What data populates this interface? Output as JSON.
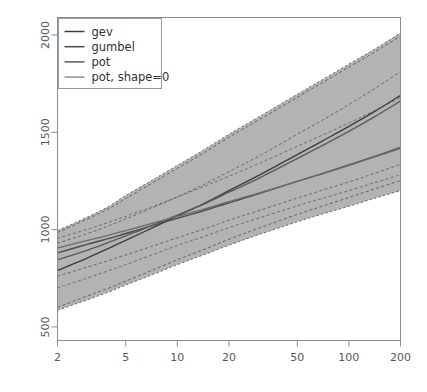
{
  "chart_data": {
    "type": "line",
    "title": "",
    "xlabel": "",
    "ylabel": "",
    "xscale": "log",
    "yscale": "linear",
    "xlim": [
      2,
      200
    ],
    "ylim": [
      430,
      2090
    ],
    "grid": false,
    "legend_position": "top-left",
    "xticks": [
      2,
      5,
      10,
      20,
      50,
      100,
      200
    ],
    "xticklabels": [
      "2",
      "5",
      "10",
      "20",
      "50",
      "100",
      "200"
    ],
    "yticks": [
      500,
      1000,
      1500,
      2000
    ],
    "yticklabels": [
      "500",
      "1000",
      "1500",
      "2000"
    ],
    "band": {
      "name": "confidence-band",
      "fill": "#b3b3b3",
      "x": [
        2,
        3,
        4,
        5,
        7,
        10,
        14,
        20,
        30,
        50,
        70,
        100,
        140,
        200
      ],
      "upper": [
        995,
        1065,
        1120,
        1175,
        1250,
        1330,
        1405,
        1490,
        1580,
        1695,
        1770,
        1850,
        1925,
        2010
      ],
      "lower": [
        585,
        640,
        680,
        715,
        765,
        820,
        868,
        920,
        975,
        1040,
        1080,
        1120,
        1160,
        1200
      ]
    },
    "series": [
      {
        "name": "gev",
        "color": "#3c3c3c",
        "dash": "solid",
        "x": [
          2,
          3,
          4,
          5,
          7,
          10,
          14,
          20,
          30,
          50,
          70,
          100,
          140,
          200
        ],
        "values": [
          790,
          855,
          905,
          945,
          1005,
          1070,
          1130,
          1200,
          1280,
          1385,
          1455,
          1530,
          1605,
          1690
        ]
      },
      {
        "name": "gumbel",
        "color": "#4a4a4a",
        "dash": "solid",
        "x": [
          2,
          3,
          4,
          5,
          7,
          10,
          14,
          20,
          30,
          50,
          70,
          100,
          140,
          200
        ],
        "values": [
          880,
          925,
          955,
          980,
          1018,
          1058,
          1095,
          1138,
          1185,
          1248,
          1288,
          1332,
          1375,
          1422
        ]
      },
      {
        "name": "pot",
        "color": "#5a5a5a",
        "dash": "solid",
        "x": [
          2,
          3,
          4,
          5,
          7,
          10,
          14,
          20,
          30,
          50,
          70,
          100,
          140,
          200
        ],
        "values": [
          845,
          895,
          935,
          968,
          1018,
          1075,
          1128,
          1192,
          1265,
          1365,
          1432,
          1505,
          1578,
          1660
        ]
      },
      {
        "name": "pot, shape=0",
        "color": "#6b6b6b",
        "dash": "solid",
        "x": [
          2,
          3,
          4,
          5,
          7,
          10,
          14,
          20,
          30,
          50,
          70,
          100,
          140,
          200
        ],
        "values": [
          905,
          945,
          972,
          995,
          1030,
          1068,
          1103,
          1143,
          1188,
          1248,
          1287,
          1330,
          1372,
          1418
        ]
      }
    ],
    "ci_curves": [
      {
        "name": "gev-upper-ci",
        "color": "#5e5e5e",
        "dash": "dashed",
        "x": [
          2,
          3,
          4,
          5,
          7,
          10,
          14,
          20,
          30,
          50,
          70,
          100,
          140,
          200
        ],
        "values": [
          985,
          1055,
          1108,
          1160,
          1235,
          1315,
          1390,
          1475,
          1565,
          1680,
          1755,
          1835,
          1910,
          1995
        ]
      },
      {
        "name": "gev-lower-ci",
        "color": "#5e5e5e",
        "dash": "dashed",
        "x": [
          2,
          3,
          4,
          5,
          7,
          10,
          14,
          20,
          30,
          50,
          70,
          100,
          140,
          200
        ],
        "values": [
          600,
          660,
          700,
          735,
          788,
          845,
          895,
          950,
          1008,
          1078,
          1120,
          1165,
          1208,
          1252
        ]
      },
      {
        "name": "gumbel-upper-ci",
        "color": "#6a6a6a",
        "dash": "dashed",
        "x": [
          2,
          3,
          4,
          5,
          7,
          10,
          14,
          20,
          30,
          50,
          70,
          100,
          140,
          200
        ],
        "values": [
          955,
          1002,
          1038,
          1068,
          1115,
          1168,
          1218,
          1275,
          1340,
          1428,
          1485,
          1548,
          1610,
          1678
        ]
      },
      {
        "name": "gumbel-lower-ci",
        "color": "#6a6a6a",
        "dash": "dashed",
        "x": [
          2,
          3,
          4,
          5,
          7,
          10,
          14,
          20,
          30,
          50,
          70,
          100,
          140,
          200
        ],
        "values": [
          700,
          752,
          790,
          820,
          868,
          918,
          962,
          1010,
          1060,
          1122,
          1160,
          1200,
          1240,
          1282
        ]
      },
      {
        "name": "pot-upper-ci",
        "color": "#646464",
        "dash": "dashed",
        "x": [
          2,
          3,
          4,
          5,
          7,
          10,
          14,
          20,
          30,
          50,
          70,
          100,
          140,
          200
        ],
        "values": [
          930,
          980,
          1020,
          1055,
          1108,
          1168,
          1228,
          1298,
          1378,
          1490,
          1562,
          1642,
          1722,
          1812
        ]
      },
      {
        "name": "pot-lower-ci",
        "color": "#646464",
        "dash": "dashed",
        "x": [
          2,
          3,
          4,
          5,
          7,
          10,
          14,
          20,
          30,
          50,
          70,
          100,
          140,
          200
        ],
        "values": [
          760,
          808,
          842,
          870,
          912,
          958,
          1000,
          1048,
          1098,
          1162,
          1202,
          1245,
          1288,
          1335
        ]
      }
    ],
    "legend": [
      {
        "label": "gev",
        "color": "#3c3c3c"
      },
      {
        "label": "gumbel",
        "color": "#4a4a4a"
      },
      {
        "label": "pot",
        "color": "#5a5a5a"
      },
      {
        "label": "pot, shape=0",
        "color": "#8f8f8f"
      }
    ]
  },
  "axes": {
    "frame_color": "#8a8d90",
    "tick_color": "#8a8d90",
    "label_color": "#55585c"
  }
}
